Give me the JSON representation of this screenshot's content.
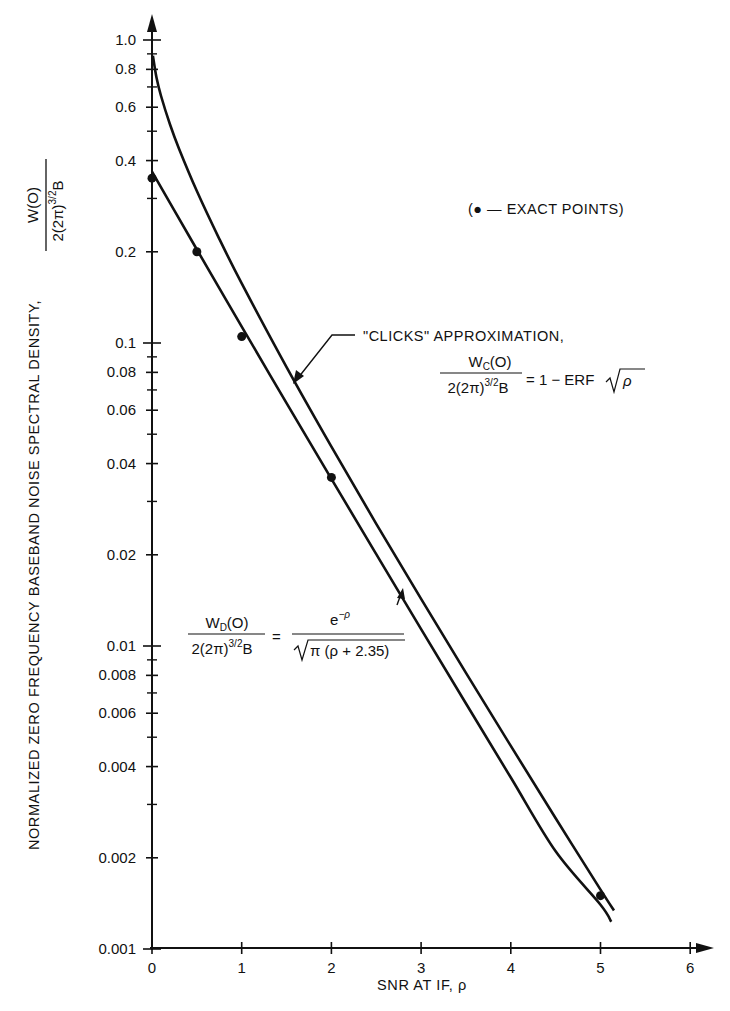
{
  "chart_data": {
    "type": "line",
    "title": "",
    "xlabel": "SNR AT IF, ρ",
    "ylabel": "NORMALIZED ZERO FREQUENCY BASEBAND NOISE SPECTRAL DENSITY,",
    "ylabel_fraction": {
      "numerator": "W(O)",
      "denominator": "2(2π)",
      "denominator_sup": "3/2",
      "denominator_tail": "B"
    },
    "xscale": "linear",
    "yscale": "log",
    "xlim": [
      0,
      6
    ],
    "ylim": [
      0.001,
      1.0
    ],
    "grid": false,
    "x_ticks": [
      0,
      1,
      2,
      3,
      4,
      5,
      6
    ],
    "x_tick_labels": [
      "0",
      "1",
      "2",
      "3",
      "4",
      "5",
      "6"
    ],
    "y_major_ticks": [
      1.0,
      0.8,
      0.6,
      0.4,
      0.2,
      0.1,
      0.08,
      0.06,
      0.04,
      0.02,
      0.01,
      0.008,
      0.006,
      0.004,
      0.002,
      0.001
    ],
    "y_tick_labels": [
      "1.0",
      "0.8",
      "0.6",
      "0.4",
      "0.2",
      "0.1",
      "0.08",
      "0.06",
      "0.04",
      "0.02",
      "0.01",
      "0.008",
      "0.006",
      "0.004",
      "0.002",
      "0.001"
    ],
    "y_minor_ticks": [
      0.9,
      0.7,
      0.5,
      0.3,
      0.09,
      0.07,
      0.05,
      0.03,
      0.009,
      0.007,
      0.005,
      0.003
    ],
    "series": [
      {
        "name": "\"CLICKS\" APPROXIMATION",
        "formula": "Wc(O) / 2(2π)^{3/2}B = 1 - ERF√ρ",
        "x": [
          0.01,
          0.05,
          0.1,
          0.2,
          0.3,
          0.5,
          0.75,
          1.0,
          1.5,
          2.0,
          2.5,
          3.0,
          3.5,
          4.0,
          4.5,
          5.0,
          5.15
        ],
        "y": [
          0.8875,
          0.7518,
          0.6547,
          0.5271,
          0.4386,
          0.3173,
          0.2207,
          0.1573,
          0.0833,
          0.0455,
          0.0253,
          0.0143,
          0.00815,
          0.00468,
          0.0027,
          0.00157,
          0.00134
        ]
      },
      {
        "name": "W_D(O) exact-fit curve",
        "formula": "W_D(O) / 2(2π)^{3/2}B = e^{-ρ} / √(π(ρ+2.35))",
        "x": [
          0,
          0.25,
          0.5,
          0.75,
          1.0,
          1.5,
          2.0,
          2.5,
          3.0,
          3.5,
          4.0,
          4.5,
          5.0,
          5.12
        ],
        "y": [
          0.368,
          0.2734,
          0.2035,
          0.1517,
          0.1133,
          0.0633,
          0.0356,
          0.0201,
          0.01137,
          0.00646,
          0.00368,
          0.0021,
          0.0014,
          0.00123
        ]
      }
    ],
    "exact_points": {
      "label": "EXACT POINTS",
      "x": [
        0,
        0.5,
        1.0,
        2.0,
        5.0
      ],
      "y": [
        0.35,
        0.2,
        0.105,
        0.036,
        0.0015
      ]
    },
    "legend": {
      "text": "(● — EXACT POINTS)",
      "position": "upper-right"
    },
    "annotations": {
      "clicks_label": "\"CLICKS\" APPROXIMATION,",
      "clicks_num": "W",
      "clicks_num_sub": "C",
      "clicks_num_tail": "(O)",
      "clicks_den": "2(2π)",
      "clicks_den_sup": "3/2",
      "clicks_den_tail": "B",
      "clicks_rhs": "= 1 − ERF",
      "clicks_rhs_rho": "ρ",
      "wd_num": "W",
      "wd_num_sub": "D",
      "wd_num_tail": "(O)",
      "wd_den": "2(2π)",
      "wd_den_sup": "3/2",
      "wd_den_tail": "B",
      "wd_eq": "=",
      "wd_rhs_num": "e",
      "wd_rhs_num_sup": "−ρ",
      "wd_rhs_den": "π (ρ + 2.35)"
    }
  }
}
